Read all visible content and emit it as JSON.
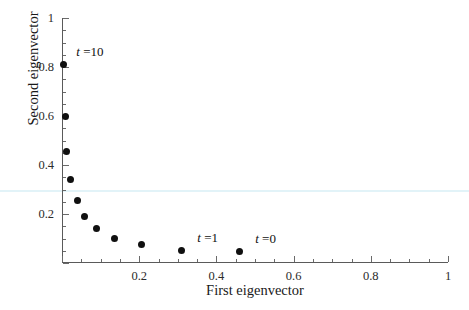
{
  "chart_data": {
    "type": "scatter",
    "title": "",
    "xlabel": "First eigenvector",
    "ylabel": "Second eigenvector",
    "xlim": [
      0,
      1
    ],
    "ylim": [
      0,
      1
    ],
    "grid": false,
    "legend": "none",
    "x_ticks_major": [
      0,
      0.2,
      0.4,
      0.6,
      0.8,
      1
    ],
    "x_tick_labels": [
      "",
      "0.2",
      "0.4",
      "0.6",
      "0.8",
      "1"
    ],
    "y_ticks_major": [
      0,
      0.2,
      0.4,
      0.6,
      0.8,
      1
    ],
    "y_tick_labels": [
      "",
      "0.2",
      "0.4",
      "0.6",
      "0.8",
      "1"
    ],
    "minor_tick_step": 0.05,
    "marker_color": "#101010",
    "axis_color": "#5a5a5a",
    "points": [
      {
        "x": 0.005,
        "y": 0.81
      },
      {
        "x": 0.008,
        "y": 0.6
      },
      {
        "x": 0.012,
        "y": 0.455
      },
      {
        "x": 0.022,
        "y": 0.34
      },
      {
        "x": 0.04,
        "y": 0.255
      },
      {
        "x": 0.058,
        "y": 0.19
      },
      {
        "x": 0.09,
        "y": 0.14
      },
      {
        "x": 0.135,
        "y": 0.1
      },
      {
        "x": 0.205,
        "y": 0.075
      },
      {
        "x": 0.31,
        "y": 0.05
      },
      {
        "x": 0.46,
        "y": 0.045
      }
    ],
    "annotations": [
      {
        "label_var": "t",
        "label_eq": " =10",
        "x": 0.005,
        "y": 0.81,
        "point_index": 0
      },
      {
        "label_var": "t",
        "label_eq": " =1",
        "x": 0.31,
        "y": 0.05,
        "point_index": 9
      },
      {
        "label_var": "t",
        "label_eq": " =0",
        "x": 0.46,
        "y": 0.045,
        "point_index": 10
      }
    ]
  }
}
